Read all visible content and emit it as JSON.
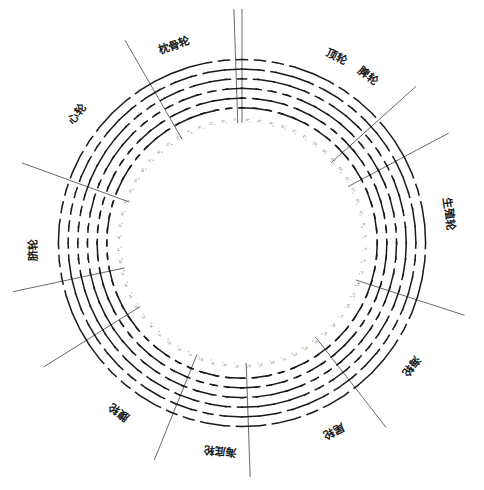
{
  "figure": {
    "kind": "radial-hexagram-wheel",
    "background": "#ffffff",
    "ink": "#1a1a1a",
    "width": 484,
    "height": 490,
    "center": {
      "x": 242,
      "y": 243
    },
    "ring": {
      "inner_radius": 128,
      "outer_radius": 186,
      "hexagram_count": 64,
      "lines_per_hexagram": 6,
      "line_styles": [
        "yang-solid",
        "yin-broken"
      ]
    }
  },
  "chart_data": {
    "type": "pie",
    "title": "",
    "xlabel": "",
    "ylabel": "",
    "legend_position": "around-ring",
    "grid": false,
    "categories": [
      "顶轮",
      "枕骨轮",
      "脾轮",
      "生殖轮",
      "海轮",
      "尾轮",
      "海底轮",
      "腹轮",
      "脐轮",
      "心轮"
    ],
    "values": [
      36,
      36,
      36,
      36,
      36,
      36,
      36,
      36,
      36,
      36
    ],
    "note": "64 I-Ching hexagrams arranged on a ring, partitioned by 10 radial divider lines into named chakra sectors."
  },
  "sectors": [
    {
      "id": "sector-dinglun",
      "label": "顶轮",
      "angle_deg": 295,
      "label_angle_deg": 297,
      "divider_angle_deg": 270
    },
    {
      "id": "sector-zhengulun",
      "label": "枕骨轮",
      "angle_deg": 248,
      "label_angle_deg": 251,
      "divider_angle_deg": 268
    },
    {
      "id": "sector-pilun",
      "label": "脾轮",
      "angle_deg": 305,
      "label_angle_deg": 307,
      "divider_angle_deg": 318
    },
    {
      "id": "sector-shengzhilun",
      "label": "生殖轮",
      "angle_deg": 352,
      "label_angle_deg": 352,
      "divider_angle_deg": 332
    },
    {
      "id": "sector-hailun",
      "label": "海轮",
      "angle_deg": 36,
      "label_angle_deg": 36,
      "divider_angle_deg": 18
    },
    {
      "id": "sector-weilun",
      "label": "尾轮",
      "angle_deg": 64,
      "label_angle_deg": 64,
      "divider_angle_deg": 52
    },
    {
      "id": "sector-haidilun",
      "label": "海底轮",
      "angle_deg": 96,
      "label_angle_deg": 96,
      "divider_angle_deg": 88
    },
    {
      "id": "sector-fulun",
      "label": "腹轮",
      "angle_deg": 126,
      "label_angle_deg": 126,
      "divider_angle_deg": 112
    },
    {
      "id": "sector-qilun",
      "label": "脐轮",
      "angle_deg": 178,
      "label_angle_deg": 178,
      "divider_angle_deg": 168
    },
    {
      "id": "sector-xinlun",
      "label": "心轮",
      "angle_deg": 216,
      "label_angle_deg": 218,
      "divider_angle_deg": 200
    }
  ],
  "dividers_deg": [
    270,
    268,
    318,
    332,
    18,
    52,
    88,
    112,
    168,
    200,
    240,
    148
  ],
  "hexagrams": [
    {
      "i": 0,
      "codon": "A",
      "sub": "u",
      "sup": "a",
      "lines": [
        1,
        0,
        1,
        0,
        1,
        0
      ]
    },
    {
      "i": 1,
      "codon": "A",
      "sub": "c",
      "sup": "a",
      "lines": [
        1,
        1,
        0,
        1,
        0,
        0
      ]
    },
    {
      "i": 2,
      "codon": "A",
      "sub": "g",
      "sup": "a",
      "lines": [
        0,
        1,
        0,
        1,
        1,
        0
      ]
    },
    {
      "i": 3,
      "codon": "C",
      "sub": "u",
      "sup": "c",
      "lines": [
        1,
        0,
        0,
        1,
        1,
        1
      ]
    },
    {
      "i": 4,
      "codon": "C",
      "sub": "c",
      "sup": "c",
      "lines": [
        1,
        1,
        1,
        0,
        0,
        1
      ]
    },
    {
      "i": 5,
      "codon": "C",
      "sub": "g",
      "sup": "c",
      "lines": [
        0,
        1,
        1,
        0,
        1,
        0
      ]
    },
    {
      "i": 6,
      "codon": "G",
      "sub": "u",
      "sup": "g",
      "lines": [
        1,
        0,
        1,
        1,
        0,
        0
      ]
    },
    {
      "i": 7,
      "codon": "G",
      "sub": "c",
      "sup": "g",
      "lines": [
        0,
        0,
        1,
        1,
        0,
        1
      ]
    },
    {
      "i": 8,
      "codon": "G",
      "sub": "g",
      "sup": "g",
      "lines": [
        1,
        1,
        0,
        0,
        1,
        0
      ]
    },
    {
      "i": 9,
      "codon": "G",
      "sub": "a",
      "sup": "g",
      "lines": [
        0,
        1,
        0,
        0,
        1,
        1
      ]
    },
    {
      "i": 10,
      "codon": "C",
      "sub": "a",
      "sup": "c",
      "lines": [
        1,
        0,
        1,
        0,
        0,
        1
      ]
    },
    {
      "i": 11,
      "codon": "C",
      "sub": "u",
      "sup": "a",
      "lines": [
        0,
        0,
        1,
        0,
        1,
        1
      ]
    },
    {
      "i": 12,
      "codon": "G",
      "sub": "u",
      "sup": "a",
      "lines": [
        1,
        1,
        0,
        1,
        1,
        0
      ]
    },
    {
      "i": 13,
      "codon": "A",
      "sub": "u",
      "sup": "c",
      "lines": [
        0,
        1,
        1,
        1,
        0,
        0
      ]
    },
    {
      "i": 14,
      "codon": "A",
      "sub": "g",
      "sup": "c",
      "lines": [
        1,
        0,
        0,
        0,
        1,
        1
      ]
    },
    {
      "i": 15,
      "codon": "T",
      "sub": "u",
      "sup": "t",
      "lines": [
        0,
        0,
        0,
        1,
        1,
        1
      ]
    },
    {
      "i": 16,
      "codon": "T",
      "sub": "c",
      "sup": "t",
      "lines": [
        1,
        1,
        1,
        1,
        0,
        0
      ]
    },
    {
      "i": 17,
      "codon": "T",
      "sub": "g",
      "sup": "t",
      "lines": [
        0,
        1,
        0,
        1,
        0,
        1
      ]
    },
    {
      "i": 18,
      "codon": "T",
      "sub": "a",
      "sup": "t",
      "lines": [
        1,
        0,
        1,
        0,
        1,
        1
      ]
    },
    {
      "i": 19,
      "codon": "A",
      "sub": "a",
      "sup": "a",
      "lines": [
        1,
        1,
        1,
        1,
        1,
        1
      ]
    },
    {
      "i": 20,
      "codon": "C",
      "sub": "c",
      "sup": "a",
      "lines": [
        0,
        0,
        0,
        0,
        0,
        0
      ]
    },
    {
      "i": 21,
      "codon": "G",
      "sub": "c",
      "sup": "a",
      "lines": [
        1,
        0,
        0,
        1,
        0,
        0
      ]
    },
    {
      "i": 22,
      "codon": "T",
      "sub": "c",
      "sup": "a",
      "lines": [
        0,
        0,
        1,
        0,
        0,
        1
      ]
    },
    {
      "i": 23,
      "codon": "A",
      "sub": "c",
      "sup": "c",
      "lines": [
        1,
        1,
        0,
        0,
        1,
        1
      ]
    },
    {
      "i": 24,
      "codon": "G",
      "sub": "g",
      "sup": "c",
      "lines": [
        0,
        1,
        1,
        0,
        0,
        1
      ]
    },
    {
      "i": 25,
      "codon": "T",
      "sub": "g",
      "sup": "c",
      "lines": [
        1,
        0,
        0,
        1,
        1,
        0
      ]
    },
    {
      "i": 26,
      "codon": "A",
      "sub": "g",
      "sup": "g",
      "lines": [
        0,
        1,
        0,
        0,
        0,
        1
      ]
    },
    {
      "i": 27,
      "codon": "C",
      "sub": "g",
      "sup": "g",
      "lines": [
        1,
        0,
        0,
        0,
        1,
        0
      ]
    },
    {
      "i": 28,
      "codon": "T",
      "sub": "u",
      "sup": "g",
      "lines": [
        0,
        0,
        1,
        1,
        1,
        0
      ]
    },
    {
      "i": 29,
      "codon": "A",
      "sub": "u",
      "sup": "g",
      "lines": [
        0,
        1,
        1,
        1,
        0,
        1
      ]
    },
    {
      "i": 30,
      "codon": "C",
      "sub": "u",
      "sup": "g",
      "lines": [
        1,
        0,
        1,
        1,
        1,
        0
      ]
    },
    {
      "i": 31,
      "codon": "G",
      "sub": "u",
      "sup": "u",
      "lines": [
        0,
        1,
        0,
        1,
        1,
        1
      ]
    },
    {
      "i": 32,
      "codon": "C",
      "sub": "c",
      "sup": "u",
      "lines": [
        1,
        1,
        1,
        0,
        1,
        0
      ]
    },
    {
      "i": 33,
      "codon": "A",
      "sub": "c",
      "sup": "u",
      "lines": [
        0,
        0,
        0,
        1,
        0,
        1
      ]
    },
    {
      "i": 34,
      "codon": "T",
      "sub": "c",
      "sup": "u",
      "lines": [
        1,
        0,
        1,
        0,
        0,
        0
      ]
    },
    {
      "i": 35,
      "codon": "G",
      "sub": "c",
      "sup": "u",
      "lines": [
        0,
        0,
        0,
        1,
        1,
        0
      ]
    },
    {
      "i": 36,
      "codon": "A",
      "sub": "a",
      "sup": "u",
      "lines": [
        0,
        1,
        1,
        0,
        0,
        0
      ]
    },
    {
      "i": 37,
      "codon": "C",
      "sub": "a",
      "sup": "u",
      "lines": [
        0,
        0,
        0,
        1,
        1,
        1
      ]
    },
    {
      "i": 38,
      "codon": "G",
      "sub": "a",
      "sup": "u",
      "lines": [
        1,
        1,
        1,
        0,
        0,
        0
      ]
    },
    {
      "i": 39,
      "codon": "T",
      "sub": "a",
      "sup": "u",
      "lines": [
        0,
        1,
        0,
        1,
        0,
        0
      ]
    },
    {
      "i": 40,
      "codon": "A",
      "sub": "u",
      "sup": "t",
      "lines": [
        0,
        0,
        1,
        0,
        1,
        0
      ]
    },
    {
      "i": 41,
      "codon": "C",
      "sub": "u",
      "sup": "t",
      "lines": [
        1,
        0,
        1,
        1,
        0,
        1
      ]
    },
    {
      "i": 42,
      "codon": "G",
      "sub": "u",
      "sup": "t",
      "lines": [
        1,
        0,
        1,
        1,
        1,
        1
      ]
    },
    {
      "i": 43,
      "codon": "T",
      "sub": "u",
      "sup": "a",
      "lines": [
        1,
        1,
        1,
        1,
        0,
        1
      ]
    },
    {
      "i": 44,
      "codon": "A",
      "sub": "g",
      "sup": "t",
      "lines": [
        0,
        1,
        1,
        1,
        1,
        1
      ]
    },
    {
      "i": 45,
      "codon": "C",
      "sub": "g",
      "sup": "t",
      "lines": [
        1,
        1,
        1,
        1,
        1,
        0
      ]
    },
    {
      "i": 46,
      "codon": "G",
      "sub": "g",
      "sup": "t",
      "lines": [
        0,
        0,
        0,
        0,
        1,
        0
      ]
    },
    {
      "i": 47,
      "codon": "T",
      "sub": "g",
      "sup": "a",
      "lines": [
        0,
        1,
        0,
        0,
        0,
        0
      ]
    },
    {
      "i": 48,
      "codon": "A",
      "sub": "c",
      "sup": "t",
      "lines": [
        0,
        0,
        0,
        0,
        0,
        1
      ]
    },
    {
      "i": 49,
      "codon": "C",
      "sub": "c",
      "sup": "t",
      "lines": [
        1,
        0,
        0,
        0,
        0,
        0
      ]
    },
    {
      "i": 50,
      "codon": "G",
      "sub": "c",
      "sup": "t",
      "lines": [
        0,
        0,
        1,
        0,
        0,
        0
      ]
    },
    {
      "i": 51,
      "codon": "T",
      "sub": "c",
      "sup": "g",
      "lines": [
        0,
        0,
        0,
        1,
        0,
        0
      ]
    },
    {
      "i": 52,
      "codon": "A",
      "sub": "a",
      "sup": "c",
      "lines": [
        1,
        1,
        0,
        1,
        1,
        1
      ]
    },
    {
      "i": 53,
      "codon": "C",
      "sub": "a",
      "sup": "g",
      "lines": [
        1,
        0,
        1,
        1,
        0,
        0
      ]
    },
    {
      "i": 54,
      "codon": "G",
      "sub": "a",
      "sup": "c",
      "lines": [
        0,
        0,
        1,
        1,
        0,
        0
      ]
    },
    {
      "i": 55,
      "codon": "T",
      "sub": "a",
      "sup": "c",
      "lines": [
        0,
        0,
        1,
        1,
        1,
        1
      ]
    },
    {
      "i": 56,
      "codon": "A",
      "sub": "g",
      "sup": "u",
      "lines": [
        1,
        1,
        0,
        0,
        1,
        1
      ]
    },
    {
      "i": 57,
      "codon": "C",
      "sub": "g",
      "sup": "u",
      "lines": [
        1,
        1,
        0,
        0,
        0,
        0
      ]
    },
    {
      "i": 58,
      "codon": "G",
      "sub": "g",
      "sup": "u",
      "lines": [
        0,
        0,
        0,
        0,
        1,
        1
      ]
    },
    {
      "i": 59,
      "codon": "T",
      "sub": "g",
      "sup": "u",
      "lines": [
        1,
        1,
        0,
        1,
        0,
        1
      ]
    },
    {
      "i": 60,
      "codon": "A",
      "sub": "u",
      "sup": "u",
      "lines": [
        1,
        0,
        1,
        0,
        1,
        1
      ]
    },
    {
      "i": 61,
      "codon": "C",
      "sub": "u",
      "sup": "u",
      "lines": [
        1,
        1,
        0,
        1,
        0,
        1
      ]
    },
    {
      "i": 62,
      "codon": "G",
      "sub": "u",
      "sup": "c",
      "lines": [
        0,
        1,
        0,
        1,
        1,
        0
      ]
    },
    {
      "i": 63,
      "codon": "T",
      "sub": "u",
      "sup": "c",
      "lines": [
        0,
        1,
        1,
        0,
        1,
        0
      ]
    }
  ]
}
